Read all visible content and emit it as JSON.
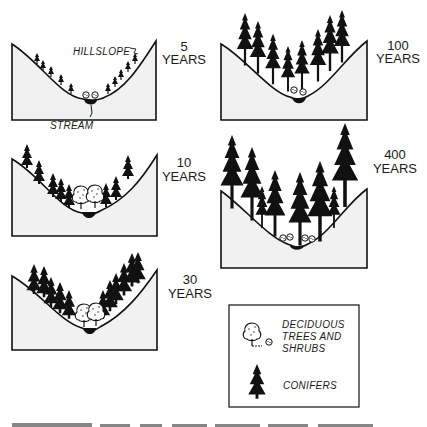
{
  "figure": {
    "panels": [
      {
        "id": "5",
        "age_number": "5",
        "age_unit": "YEARS",
        "annotation_top": "HILLSLOPE",
        "annotation_bottom": "STREAM"
      },
      {
        "id": "10",
        "age_number": "10",
        "age_unit": "YEARS"
      },
      {
        "id": "30",
        "age_number": "30",
        "age_unit": "YEARS"
      },
      {
        "id": "100",
        "age_number": "100",
        "age_unit": "YEARS"
      },
      {
        "id": "400",
        "age_number": "400",
        "age_unit": "YEARS"
      }
    ],
    "legend": {
      "deciduous_line1": "DECIDUOUS",
      "deciduous_line2": "TREES AND",
      "deciduous_line3": "SHRUBS",
      "conifers": "CONIFERS"
    }
  },
  "colors": {
    "ink": "#111111",
    "hill_fill": "#f1f1f1",
    "background": "#ffffff"
  }
}
